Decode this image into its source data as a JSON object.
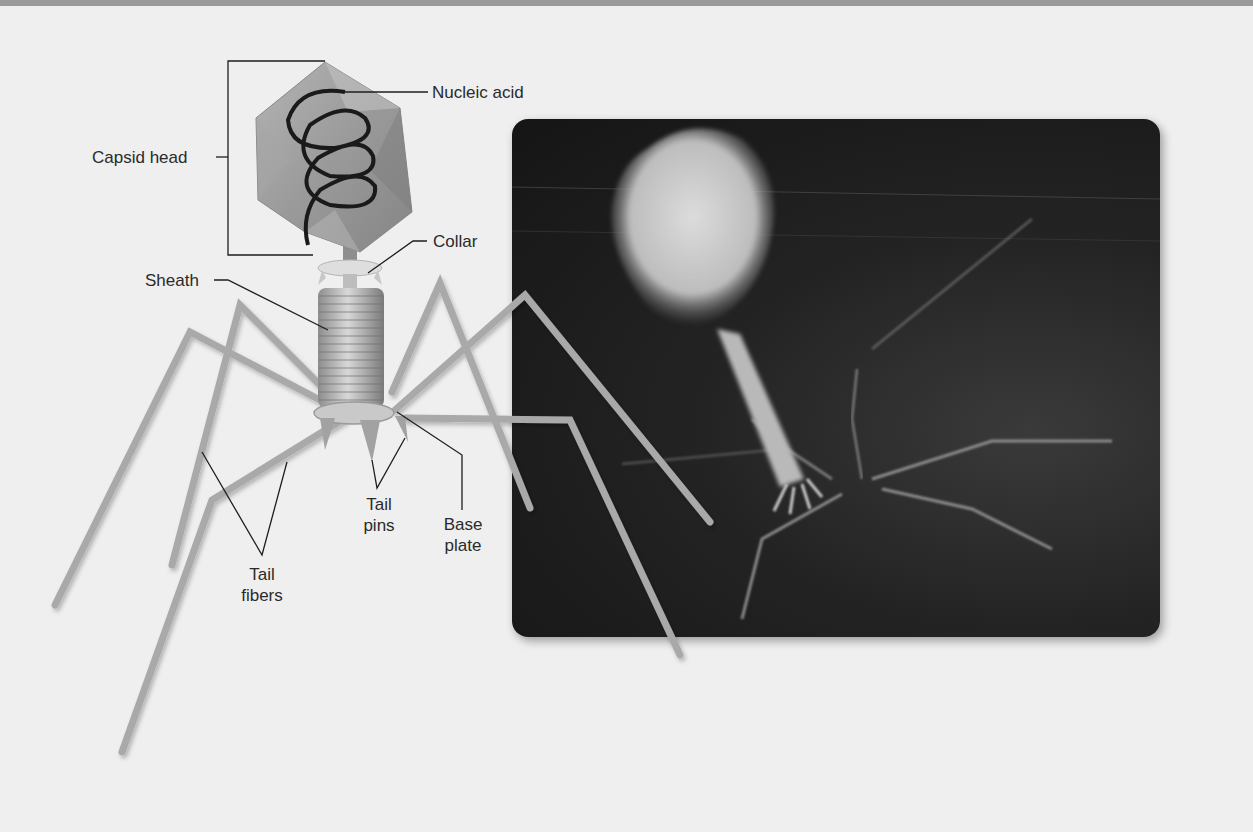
{
  "figure": {
    "illustration": {
      "labels": {
        "nucleic_acid": "Nucleic acid",
        "capsid_head": "Capsid head",
        "collar": "Collar",
        "sheath": "Sheath",
        "tail_pins_line1": "Tail",
        "tail_pins_line2": "pins",
        "base_plate_line1": "Base",
        "base_plate_line2": "plate",
        "tail_fibers_line1": "Tail",
        "tail_fibers_line2": "fibers"
      }
    },
    "micrograph": {
      "description": "Electron micrograph of bacteriophage"
    }
  },
  "colors": {
    "background": "#efefef",
    "top_bar": "#9a9a9a",
    "label_text": "#2a2a2a",
    "leader_line": "#1e1e1e",
    "capsid": "#9c9c9c",
    "fiber": "#a8a8a8",
    "micrograph_bg": "#1c1c1c"
  }
}
